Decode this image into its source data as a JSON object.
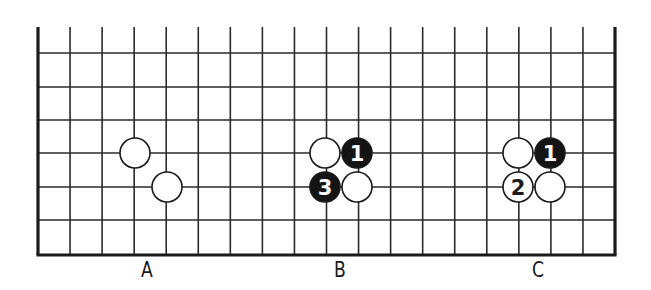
{
  "diagram": {
    "type": "go-board-fragment",
    "colors": {
      "line": "#2a2a2a",
      "edge": "#1a1a1a",
      "black_stone": "#141414",
      "white_stone": "#ffffff",
      "background": "#ffffff"
    },
    "grid": {
      "left_x": 38,
      "right_x": 615,
      "columns": 19,
      "top_open_y": 27,
      "rows_y": [
        53,
        87,
        120,
        153,
        187,
        220
      ],
      "bottom_edge_y": 255
    },
    "stone_radius": 15,
    "panels": [
      {
        "label": "A",
        "label_x": 147,
        "stones": [
          {
            "color": "white",
            "x": 135,
            "y": 153,
            "number": ""
          },
          {
            "color": "white",
            "x": 167,
            "y": 187,
            "number": ""
          }
        ]
      },
      {
        "label": "B",
        "label_x": 340,
        "stones": [
          {
            "color": "white",
            "x": 325,
            "y": 153,
            "number": ""
          },
          {
            "color": "black",
            "x": 357,
            "y": 153,
            "number": "1"
          },
          {
            "color": "black",
            "x": 325,
            "y": 187,
            "number": "3"
          },
          {
            "color": "white",
            "x": 357,
            "y": 187,
            "number": ""
          }
        ]
      },
      {
        "label": "C",
        "label_x": 538,
        "stones": [
          {
            "color": "white",
            "x": 518,
            "y": 153,
            "number": ""
          },
          {
            "color": "black",
            "x": 550,
            "y": 153,
            "number": "1"
          },
          {
            "color": "white",
            "x": 518,
            "y": 187,
            "number": "2"
          },
          {
            "color": "white",
            "x": 550,
            "y": 187,
            "number": ""
          }
        ]
      }
    ]
  }
}
